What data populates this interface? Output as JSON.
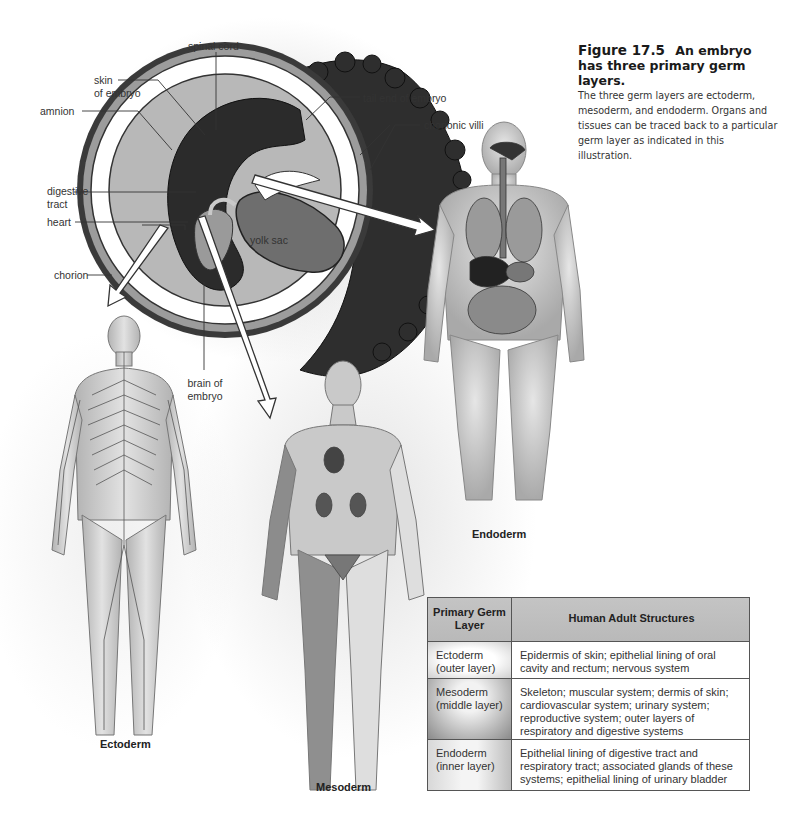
{
  "caption": {
    "figure_number": "Figure 17.5",
    "title": "An embryo has three primary germ layers.",
    "description": "The three germ layers are ectoderm, mesoderm, and endoderm. Organs and tissues can be traced back to a particular germ layer as indicated in this illustration."
  },
  "embryo_labels": {
    "spinal_cord": "spinal cord",
    "tail_end": "tail end of embryo",
    "skin_line1": "skin",
    "skin_line2": "of embryo",
    "amnion": "amnion",
    "chorionic_villi": "chorionic villi",
    "digestive_line1": "digestive",
    "digestive_line2": "tract",
    "heart": "heart",
    "yolk_sac": "yolk sac",
    "chorion": "chorion",
    "brain_line1": "brain of",
    "brain_line2": "embryo"
  },
  "figures": {
    "ectoderm": "Ectoderm",
    "mesoderm": "Mesoderm",
    "endoderm": "Endoderm"
  },
  "table": {
    "headers": {
      "col1": "Primary Germ Layer",
      "col2": "Human Adult Structures"
    },
    "rows": [
      {
        "layer": "Ectoderm (outer layer)",
        "structures": "Epidermis of skin; epithelial lining of oral cavity and rectum; nervous system"
      },
      {
        "layer": "Mesoderm (middle layer)",
        "structures": "Skeleton; muscular system; dermis of skin; cardiovascular system; urinary system; reproductive system; outer layers of respiratory and digestive systems"
      },
      {
        "layer": "Endoderm (inner layer)",
        "structures": "Epithelial lining of digestive tract and respiratory tract; associated glands of these systems; epithelial lining of urinary bladder"
      }
    ]
  },
  "colors": {
    "table_header_bg": "#bfbfbf",
    "table_border": "#555555",
    "embryo_dark": "#2a2a2a",
    "embryo_mid": "#7a7a7a",
    "embryo_light": "#b5b5b5"
  }
}
